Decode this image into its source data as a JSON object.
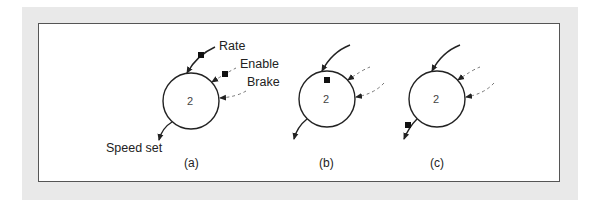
{
  "figure": {
    "panels": [
      {
        "id": "a",
        "caption": "(a)",
        "state_label": "2",
        "token_positions": [
          "Rate",
          "Enable"
        ],
        "arcs": {
          "input_solid": "Rate",
          "input_dashed_1": "Enable",
          "input_dashed_2": "Brake",
          "output_solid": "Speed set"
        }
      },
      {
        "id": "b",
        "caption": "(b)",
        "state_label": "2",
        "token_positions": [
          "place"
        ]
      },
      {
        "id": "c",
        "caption": "(c)",
        "state_label": "2",
        "token_positions": [
          "Speed set"
        ]
      }
    ],
    "labels": {
      "rate": "Rate",
      "enable": "Enable",
      "brake": "Brake",
      "speed_set": "Speed set"
    },
    "colors": {
      "frame": "#e9e9e9",
      "panel": "#ffffff",
      "border": "#555555",
      "stroke": "#222222",
      "dashed": "#777777"
    }
  }
}
